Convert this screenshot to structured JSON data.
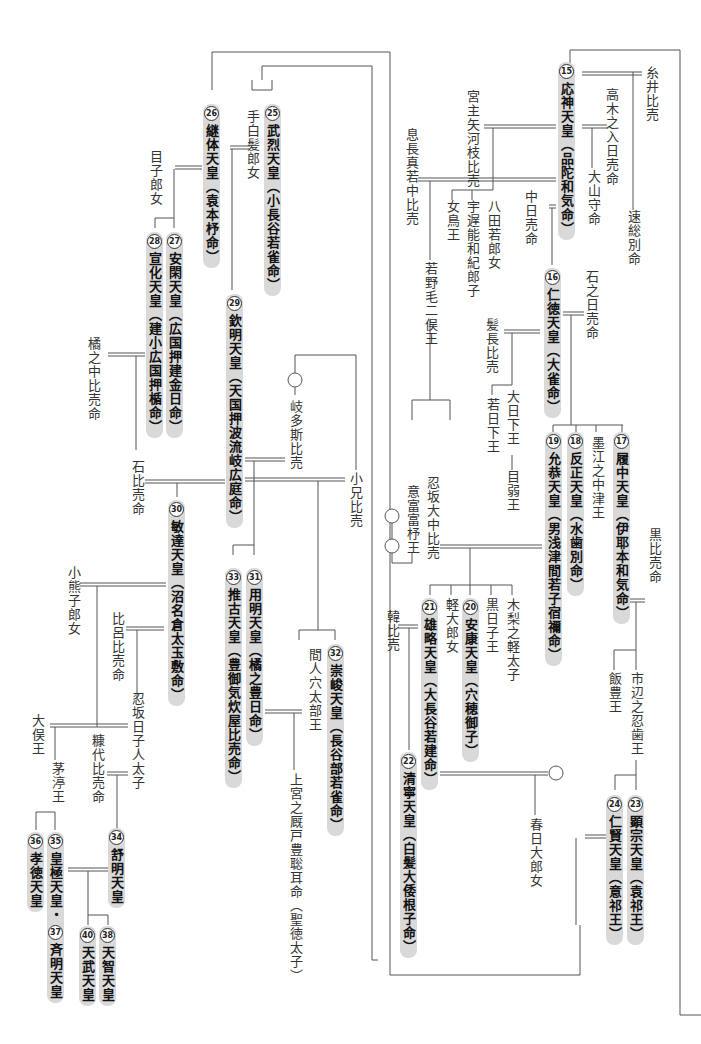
{
  "diagram": {
    "type": "imperial-genealogy",
    "emperors": [
      {
        "num": "15",
        "name": "応神天皇（品陀和気命）"
      },
      {
        "num": "16",
        "name": "仁徳天皇（大雀命）"
      },
      {
        "num": "17",
        "name": "履中天皇（伊耶本和気命）"
      },
      {
        "num": "18",
        "name": "反正天皇（水歯別命）"
      },
      {
        "num": "19",
        "name": "允恭天皇（男浅津間若子宿禰命）"
      },
      {
        "num": "20",
        "name": "安康天皇（穴穂御子）"
      },
      {
        "num": "21",
        "name": "雄略天皇（大長谷若建命）"
      },
      {
        "num": "22",
        "name": "清寧天皇（白髪大倭根子命）"
      },
      {
        "num": "23",
        "name": "顕宗天皇（袁祁王）"
      },
      {
        "num": "24",
        "name": "仁賢天皇（意祁王）"
      },
      {
        "num": "25",
        "name": "武烈天皇（小長谷若雀命）"
      },
      {
        "num": "26",
        "name": "継体天皇（袁本杼命）"
      },
      {
        "num": "27",
        "name": "安閑天皇（広国押建金日命）"
      },
      {
        "num": "28",
        "name": "宣化天皇（建小広国押楯命）"
      },
      {
        "num": "29",
        "name": "欽明天皇（天国押波流岐広庭命）"
      },
      {
        "num": "30",
        "name": "敏達天皇（沼名倉太玉敷命）"
      },
      {
        "num": "31",
        "name": "用明天皇（橘之豊日命）"
      },
      {
        "num": "32",
        "name": "崇峻天皇（長谷部若雀命）"
      },
      {
        "num": "33",
        "name": "推古天皇（豊御気炊屋比売命）"
      },
      {
        "num": "34",
        "name": "舒明天皇"
      },
      {
        "num": "35",
        "name": "皇極天皇・"
      },
      {
        "num": "37",
        "name": "斉明天皇"
      },
      {
        "num": "36",
        "name": "孝徳天皇"
      },
      {
        "num": "38",
        "name": "天智天皇"
      },
      {
        "num": "40",
        "name": "天武天皇"
      }
    ],
    "persons": [
      "糸井比売",
      "高木之入日売命",
      "大山守命",
      "速総別命",
      "宮主矢河枝比売",
      "息長真若中比売",
      "八田若郎女",
      "宇遅能和紀郎子",
      "女鳥王",
      "中日売命",
      "若野毛二俣王",
      "石之日売命",
      "髪長比売",
      "大日下王",
      "若日下王",
      "目弱王",
      "墨江之中津王",
      "黒比売命",
      "意富富杼王",
      "忍坂大中比売",
      "木梨之軽太子",
      "黒日子王",
      "軽大郎女",
      "韓比売",
      "市辺之忍歯王",
      "飯豊王",
      "春日大郎女",
      "手白髪郎女",
      "目子郎女",
      "橘之中比売命",
      "石比売命",
      "岐多斯比売",
      "小兄比売",
      "間人穴太部王",
      "上宮之厩戸豊聡耳命（聖徳太子）",
      "小熊子郎女",
      "比呂比売命",
      "忍坂日子人太子",
      "大俣王",
      "糠代比売命",
      "茅渟王"
    ]
  }
}
